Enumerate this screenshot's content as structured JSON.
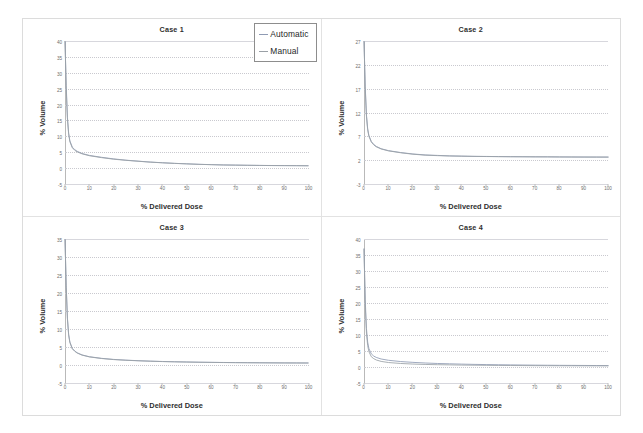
{
  "figure": {
    "layout": "2x2 grid of dose-volume histogram panels",
    "legend": {
      "items": [
        {
          "label": "Automatic",
          "color": "#8f9bb3",
          "swatch": "line-swatch-icon"
        },
        {
          "label": "Manual",
          "color": "#9aa0a6",
          "swatch": "line-swatch-icon"
        }
      ]
    }
  },
  "chart_data": [
    {
      "type": "line",
      "title": "Case 1",
      "xlabel": "% Delivered Dose",
      "ylabel": "% Volume",
      "xlim": [
        0,
        100
      ],
      "ylim": [
        -5,
        40
      ],
      "xticks": [
        0,
        10,
        20,
        30,
        40,
        50,
        60,
        70,
        80,
        90,
        100
      ],
      "yticks": [
        40,
        35,
        30,
        25,
        20,
        15,
        10,
        5,
        0,
        -5
      ],
      "grid": true,
      "legend_position": "upper right",
      "x": [
        0,
        0.5,
        1,
        1.5,
        2,
        3,
        4,
        5,
        7,
        10,
        15,
        20,
        25,
        30,
        35,
        40,
        45,
        50,
        55,
        60,
        65,
        70,
        75,
        80,
        85,
        90,
        95,
        100
      ],
      "series": [
        {
          "name": "Automatic",
          "values": [
            40,
            26,
            16,
            11,
            8.6,
            6.6,
            5.8,
            5.3,
            4.6,
            4.0,
            3.4,
            2.9,
            2.5,
            2.2,
            1.9,
            1.7,
            1.5,
            1.35,
            1.2,
            1.1,
            1.0,
            0.95,
            0.9,
            0.85,
            0.82,
            0.8,
            0.78,
            0.75
          ]
        },
        {
          "name": "Manual",
          "values": [
            40,
            25,
            15.5,
            10.7,
            8.3,
            6.4,
            5.6,
            5.1,
            4.5,
            3.9,
            3.3,
            2.8,
            2.45,
            2.15,
            1.88,
            1.66,
            1.48,
            1.33,
            1.18,
            1.08,
            0.98,
            0.93,
            0.88,
            0.84,
            0.8,
            0.78,
            0.76,
            0.73
          ]
        }
      ]
    },
    {
      "type": "line",
      "title": "Case 2",
      "xlabel": "% Delivered Dose",
      "ylabel": "% Volume",
      "xlim": [
        0,
        100
      ],
      "ylim": [
        -3,
        27
      ],
      "xticks": [
        0,
        10,
        20,
        30,
        40,
        50,
        60,
        70,
        80,
        90,
        100
      ],
      "yticks": [
        27,
        22,
        17,
        12,
        7,
        2,
        -3
      ],
      "grid": true,
      "legend_position": "none",
      "x": [
        0,
        0.5,
        1,
        1.5,
        2,
        3,
        4,
        5,
        7,
        10,
        15,
        20,
        25,
        30,
        35,
        40,
        45,
        50,
        55,
        60,
        65,
        70,
        75,
        80,
        85,
        90,
        95,
        100
      ],
      "series": [
        {
          "name": "Automatic",
          "values": [
            27,
            17.5,
            11.5,
            8.6,
            7.2,
            5.9,
            5.3,
            4.9,
            4.4,
            4.0,
            3.6,
            3.3,
            3.1,
            3.0,
            2.9,
            2.85,
            2.8,
            2.78,
            2.75,
            2.73,
            2.72,
            2.7,
            2.7,
            2.68,
            2.67,
            2.66,
            2.65,
            2.65
          ]
        },
        {
          "name": "Manual",
          "values": [
            27,
            17,
            11.2,
            8.4,
            7.0,
            5.8,
            5.2,
            4.8,
            4.35,
            3.95,
            3.55,
            3.25,
            3.05,
            2.95,
            2.88,
            2.83,
            2.79,
            2.76,
            2.74,
            2.72,
            2.71,
            2.7,
            2.69,
            2.67,
            2.66,
            2.65,
            2.65,
            2.64
          ]
        }
      ]
    },
    {
      "type": "line",
      "title": "Case 3",
      "xlabel": "% Delivered Dose",
      "ylabel": "% Volume",
      "xlim": [
        0,
        100
      ],
      "ylim": [
        -5,
        35
      ],
      "xticks": [
        0,
        10,
        20,
        30,
        40,
        50,
        60,
        70,
        80,
        90,
        100
      ],
      "yticks": [
        35,
        30,
        25,
        20,
        15,
        10,
        5,
        0,
        -5
      ],
      "grid": true,
      "legend_position": "none",
      "x": [
        0,
        0.5,
        1,
        1.5,
        2,
        3,
        4,
        5,
        7,
        10,
        15,
        20,
        25,
        30,
        35,
        40,
        45,
        50,
        55,
        60,
        65,
        70,
        75,
        80,
        85,
        90,
        95,
        100
      ],
      "series": [
        {
          "name": "Automatic",
          "values": [
            35,
            22,
            13,
            8.5,
            6.4,
            4.6,
            3.9,
            3.4,
            2.8,
            2.3,
            1.85,
            1.55,
            1.35,
            1.2,
            1.08,
            0.98,
            0.9,
            0.84,
            0.78,
            0.74,
            0.7,
            0.67,
            0.64,
            0.62,
            0.6,
            0.58,
            0.57,
            0.56
          ]
        },
        {
          "name": "Manual",
          "values": [
            35,
            21.5,
            12.7,
            8.3,
            6.25,
            4.5,
            3.8,
            3.32,
            2.74,
            2.25,
            1.8,
            1.5,
            1.31,
            1.17,
            1.05,
            0.95,
            0.88,
            0.82,
            0.76,
            0.72,
            0.68,
            0.65,
            0.63,
            0.61,
            0.59,
            0.57,
            0.56,
            0.55
          ]
        }
      ]
    },
    {
      "type": "line",
      "title": "Case 4",
      "xlabel": "% Delivered Dose",
      "ylabel": "% Volume",
      "xlim": [
        0,
        100
      ],
      "ylim": [
        -5,
        40
      ],
      "xticks": [
        0,
        10,
        20,
        30,
        40,
        50,
        60,
        70,
        80,
        90,
        100
      ],
      "yticks": [
        40,
        35,
        30,
        25,
        20,
        15,
        10,
        5,
        0,
        -5
      ],
      "grid": true,
      "legend_position": "none",
      "x": [
        0,
        0.5,
        1,
        1.5,
        2,
        3,
        4,
        5,
        7,
        10,
        15,
        20,
        25,
        30,
        35,
        40,
        45,
        50,
        55,
        60,
        65,
        70,
        75,
        80,
        85,
        90,
        95,
        100
      ],
      "series": [
        {
          "name": "Automatic",
          "values": [
            37,
            21,
            12,
            7.8,
            5.8,
            4.1,
            3.4,
            3.0,
            2.5,
            2.1,
            1.7,
            1.45,
            1.25,
            1.1,
            1.0,
            0.9,
            0.82,
            0.76,
            0.7,
            0.66,
            0.62,
            0.58,
            0.55,
            0.52,
            0.5,
            0.48,
            0.46,
            0.45
          ]
        },
        {
          "name": "Manual",
          "values": [
            37,
            19.5,
            10.6,
            6.7,
            4.8,
            3.2,
            2.6,
            2.2,
            1.75,
            1.4,
            1.1,
            0.92,
            0.8,
            0.72,
            0.66,
            0.6,
            0.56,
            0.52,
            0.49,
            0.46,
            0.44,
            0.42,
            0.4,
            0.39,
            0.38,
            0.37,
            0.36,
            0.35
          ]
        }
      ]
    }
  ]
}
